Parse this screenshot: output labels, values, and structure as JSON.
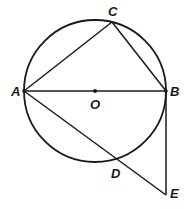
{
  "diagram": {
    "circle": {
      "center": "O",
      "cx": 95,
      "cy": 91,
      "r": 71
    },
    "points": {
      "A": {
        "label": "A",
        "x": 24,
        "y": 91
      },
      "B": {
        "label": "B",
        "x": 166,
        "y": 91
      },
      "C": {
        "label": "C",
        "x": 112,
        "y": 22
      },
      "O": {
        "label": "O",
        "x": 95,
        "y": 91
      },
      "D": {
        "label": "D",
        "x": 116,
        "y": 159
      },
      "E": {
        "label": "E",
        "x": 166,
        "y": 195
      }
    },
    "segments": [
      "AC",
      "CB",
      "AB",
      "AE",
      "BE"
    ],
    "stroke_color": "#1a1a1a"
  }
}
